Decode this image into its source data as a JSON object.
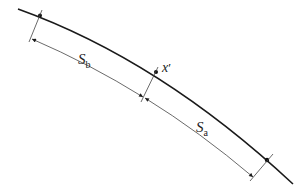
{
  "diagram": {
    "type": "arc-length-dimension",
    "colors": {
      "curve": "#1a1a1a",
      "dimension": "#444444",
      "text": "#222222",
      "background": "#ffffff"
    },
    "labels": {
      "sb_main": "S",
      "sb_sub": "b",
      "sa_main": "S",
      "sa_sub": "a",
      "point_main": "x",
      "point_prime": "′"
    },
    "points": [
      {
        "name": "start-point",
        "x": 40,
        "y": 15
      },
      {
        "name": "x-prime-point",
        "x": 156,
        "y": 73
      },
      {
        "name": "end-point",
        "x": 267,
        "y": 160
      }
    ]
  }
}
